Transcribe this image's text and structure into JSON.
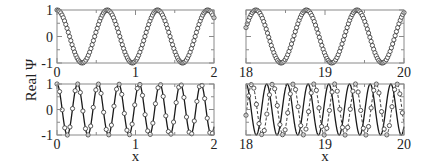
{
  "chart_data": [
    {
      "id": "top-left",
      "type": "line",
      "xlim": [
        0,
        2
      ],
      "ylim": [
        -1,
        1
      ],
      "xticks": [
        0,
        1,
        2
      ],
      "xtick_labels": [
        "0",
        "1",
        "2"
      ],
      "yticks": [
        -1,
        0,
        1
      ],
      "ytick_labels": [
        "-1",
        "0",
        "1"
      ],
      "xlabel": "",
      "series": [
        {
          "name": "analytic",
          "style": "solid",
          "function": "cos",
          "amplitude": 1,
          "period": 0.64,
          "phase": 0
        },
        {
          "name": "numerical",
          "style": "markers",
          "marker": "open-circle",
          "function": "cos",
          "amplitude": 1,
          "period": 0.64,
          "phase": 0,
          "marker_spacing": 0.016
        }
      ]
    },
    {
      "id": "top-right",
      "type": "line",
      "xlim": [
        18,
        20
      ],
      "ylim": [
        -1,
        1
      ],
      "xticks": [
        18,
        19,
        20
      ],
      "xtick_labels": [
        "18",
        "19",
        "20"
      ],
      "yticks": [
        -1,
        0,
        1
      ],
      "ytick_labels": [],
      "xlabel": "",
      "series": [
        {
          "name": "analytic",
          "style": "solid",
          "function": "cos",
          "amplitude": 1,
          "period": 0.64,
          "phase": 0.215
        },
        {
          "name": "numerical",
          "style": "markers",
          "marker": "open-circle",
          "function": "cos",
          "amplitude": 1,
          "period": 0.64,
          "phase": 0.205,
          "marker_spacing": 0.016
        }
      ]
    },
    {
      "id": "bottom-left",
      "type": "line",
      "xlim": [
        0,
        2
      ],
      "ylim": [
        -1,
        1
      ],
      "xticks": [
        0,
        1,
        2
      ],
      "xtick_labels": [
        "0",
        "1",
        "2"
      ],
      "yticks": [
        -1,
        0,
        1
      ],
      "ytick_labels": [
        "-1",
        "0",
        "1"
      ],
      "xlabel": "x",
      "series": [
        {
          "name": "analytic",
          "style": "solid",
          "function": "cos",
          "amplitude": 1,
          "period": 0.262,
          "phase": 0
        },
        {
          "name": "numerical",
          "style": "markers",
          "marker": "open-circle",
          "function": "cos",
          "amplitude": 1,
          "period": 0.262,
          "phase": 0,
          "marker_spacing": 0.033
        }
      ]
    },
    {
      "id": "bottom-right",
      "type": "line",
      "xlim": [
        18,
        20
      ],
      "ylim": [
        -1,
        1
      ],
      "xticks": [
        18,
        19,
        20
      ],
      "xtick_labels": [
        "18",
        "19",
        "20"
      ],
      "yticks": [
        -1,
        0,
        1
      ],
      "ytick_labels": [],
      "xlabel": "x",
      "series": [
        {
          "name": "analytic",
          "style": "solid",
          "function": "cos",
          "amplitude": 1,
          "period": 0.262,
          "phase": 18.0
        },
        {
          "name": "numerical",
          "style": "dashed-markers",
          "marker": "open-circle",
          "function": "cos",
          "amplitude": 1,
          "period": 0.262,
          "phase": 18.075,
          "marker_spacing": 0.033
        }
      ]
    }
  ],
  "figure": {
    "ylabel": "Real Ψ",
    "xlabel": "x"
  }
}
